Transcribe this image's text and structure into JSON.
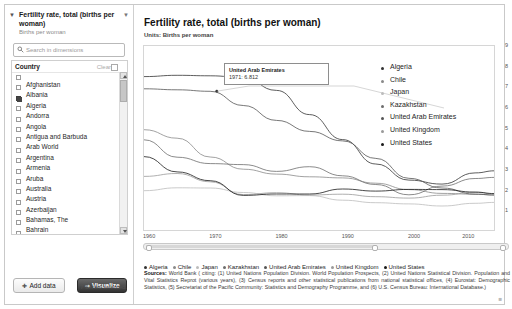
{
  "sidebar": {
    "dimension": {
      "title": "Fertility rate, total (births per woman)",
      "subtitle": "Births per woman",
      "caret_icon": "caret-down-icon",
      "caret_right_icon": "caret-down-icon"
    },
    "search": {
      "placeholder": "Search in dimensions",
      "icon": "search-icon",
      "value": ""
    },
    "facet": {
      "title": "Country",
      "clear_label": "Clear",
      "clear_icon": "clear-icon",
      "items": [
        {
          "label": "Afghanistan",
          "checked": false
        },
        {
          "label": "Albania",
          "checked": false
        },
        {
          "label": "Algeria",
          "checked": true
        },
        {
          "label": "Andorra",
          "checked": false
        },
        {
          "label": "Angola",
          "checked": false
        },
        {
          "label": "Antigua and Barbuda",
          "checked": false
        },
        {
          "label": "Arab World",
          "checked": false
        },
        {
          "label": "Argentina",
          "checked": false
        },
        {
          "label": "Armenia",
          "checked": false
        },
        {
          "label": "Aruba",
          "checked": false
        },
        {
          "label": "Australia",
          "checked": false
        },
        {
          "label": "Austria",
          "checked": false
        },
        {
          "label": "Azerbaijan",
          "checked": false
        },
        {
          "label": "Bahamas, The",
          "checked": false
        },
        {
          "label": "Bahrain",
          "checked": false
        },
        {
          "label": "Bangladesh",
          "checked": false
        },
        {
          "label": "Barbados",
          "checked": false
        },
        {
          "label": "Belarus",
          "checked": false
        }
      ]
    },
    "add_data_label": "Add data",
    "add_data_icon": "plus-icon",
    "visualize_label": "Visualize",
    "visualize_icon": "arrow-right-icon",
    "series_note": "7 series selected."
  },
  "main": {
    "title": "Fertility rate, total (births per woman)",
    "units": "Units: Births per woman",
    "tooltip": {
      "series": "United Arab Emirates",
      "value": "1971: 6.812"
    },
    "sources_label": "Sources:",
    "sources_text": "World Bank ( citing: (1) United Nations Population Division. World Population Prospects, (2) United Nations Statistical Division. Population and Vital Statistics Reprot (various years), (3) Census reports and other statistical publications from national statistical offices, (4) Eurostat: Demographic Statistics, (5) Secretariat of the Pacific Community: Statistics and Demography Programme, and (6) U.S. Census Bureau: International Database.)"
  },
  "chart_data": {
    "type": "line",
    "title": "Fertility rate, total (births per woman)",
    "subtitle": "Units: Births per woman",
    "xlabel": "",
    "ylabel": "Births per woman",
    "xlim": [
      1960,
      2013
    ],
    "ylim": [
      0,
      9
    ],
    "xticks": [
      1960,
      1970,
      1980,
      1990,
      2000,
      2010
    ],
    "yticks": [
      1,
      2,
      3,
      4,
      5,
      6,
      7,
      8,
      9
    ],
    "grid": false,
    "legend_position": "right",
    "legend": [
      "Algeria",
      "Chile",
      "Japan",
      "Kazakhstan",
      "United Arab Emirates",
      "United Kingdom",
      "United States"
    ],
    "colors": {
      "Algeria": "#333333",
      "Chile": "#8a8a8a",
      "Japan": "#bcbcbc",
      "Kazakhstan": "#6d6d6d",
      "United Arab Emirates": "#555555",
      "United Kingdom": "#9a9a9a",
      "United States": "#1a1a1a"
    },
    "x": [
      1960,
      1965,
      1970,
      1975,
      1980,
      1985,
      1990,
      1995,
      2000,
      2005,
      2010,
      2013
    ],
    "series": [
      {
        "name": "Algeria",
        "values": [
          7.52,
          7.58,
          7.56,
          7.47,
          6.85,
          5.68,
          4.47,
          3.29,
          2.51,
          2.32,
          2.86,
          2.96
        ]
      },
      {
        "name": "Chile",
        "values": [
          4.95,
          4.54,
          3.63,
          3.04,
          2.8,
          2.67,
          2.62,
          2.36,
          2.05,
          1.87,
          1.83,
          1.79
        ]
      },
      {
        "name": "Japan",
        "values": [
          2.0,
          2.14,
          2.13,
          1.91,
          1.75,
          1.76,
          1.54,
          1.42,
          1.36,
          1.26,
          1.39,
          1.43
        ]
      },
      {
        "name": "Kazakhstan",
        "values": [
          4.46,
          3.62,
          3.31,
          3.26,
          2.93,
          3.16,
          2.72,
          2.3,
          1.8,
          2.22,
          2.59,
          2.64
        ]
      },
      {
        "name": "United Arab Emirates",
        "values": [
          6.93,
          6.88,
          6.81,
          6.12,
          5.4,
          4.87,
          4.41,
          3.56,
          2.6,
          2.13,
          1.83,
          1.79
        ]
      },
      {
        "name": "United Kingdom",
        "values": [
          2.69,
          2.83,
          2.43,
          1.81,
          1.9,
          1.79,
          1.83,
          1.71,
          1.64,
          1.78,
          1.92,
          1.83
        ]
      },
      {
        "name": "United States",
        "values": [
          3.65,
          2.91,
          2.48,
          1.77,
          1.84,
          1.84,
          2.08,
          1.98,
          2.06,
          2.05,
          1.93,
          1.86
        ]
      }
    ],
    "annotation": {
      "series": "United Arab Emirates",
      "x": 1971,
      "y": 6.812,
      "label": "1971: 6.812"
    },
    "bottom_legend": [
      "Algeria",
      "Chile",
      "Japan",
      "Kazakhstan",
      "United Arab Emirates",
      "United Kingdom",
      "United States"
    ]
  }
}
